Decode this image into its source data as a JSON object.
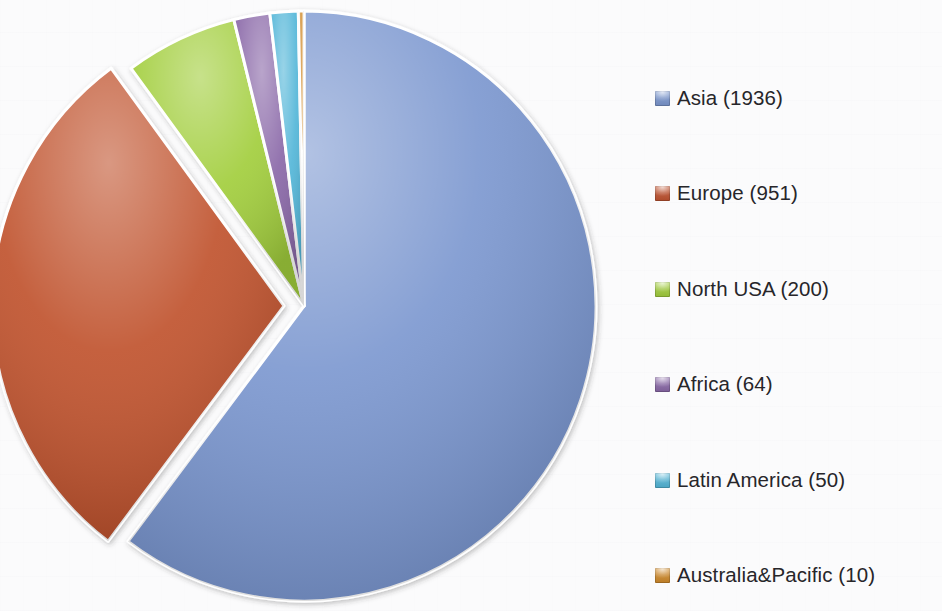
{
  "chart_data": {
    "type": "pie",
    "title": "",
    "subtitle": "",
    "xlabel": "",
    "ylabel": "",
    "grid": false,
    "legend_position": "right",
    "start_angle_deg": 0,
    "direction": "clockwise",
    "total": 3211,
    "categories": [
      "Asia",
      "Europe",
      "North USA",
      "Africa",
      "Latin America",
      "Australia&Pacific"
    ],
    "values": [
      1936,
      951,
      200,
      64,
      50,
      10
    ],
    "percentages": [
      60.3,
      29.6,
      6.2,
      2.0,
      1.6,
      0.3
    ],
    "colors": [
      "#7a96cf",
      "#c0522f",
      "#a2ce3c",
      "#8a68a8",
      "#52b6d8",
      "#d08a2a"
    ],
    "exploded": [
      "Europe"
    ],
    "slices": [
      {
        "label": "Asia",
        "value": 1936,
        "percent": 60.3,
        "color": "#7a96cf",
        "legend_text": "Asia (1936)",
        "exploded": false
      },
      {
        "label": "Europe",
        "value": 951,
        "percent": 29.6,
        "color": "#c0522f",
        "legend_text": "Europe (951)",
        "exploded": true
      },
      {
        "label": "North USA",
        "value": 200,
        "percent": 6.2,
        "color": "#a2ce3c",
        "legend_text": "North USA (200)",
        "exploded": false
      },
      {
        "label": "Africa",
        "value": 64,
        "percent": 2.0,
        "color": "#8a68a8",
        "legend_text": "Africa (64)",
        "exploded": false
      },
      {
        "label": "Latin America",
        "value": 50,
        "percent": 1.6,
        "color": "#52b6d8",
        "legend_text": "Latin America (50)",
        "exploded": false
      },
      {
        "label": "Australia&Pacific",
        "value": 10,
        "percent": 0.3,
        "color": "#d08a2a",
        "legend_text": "Australia&Pacific (10)",
        "exploded": false
      }
    ]
  },
  "legend": {
    "items": [
      {
        "label": "Asia (1936)",
        "color": "#7a96cf"
      },
      {
        "label": "Europe (951)",
        "color": "#c0522f"
      },
      {
        "label": "North USA (200)",
        "color": "#a2ce3c"
      },
      {
        "label": "Africa (64)",
        "color": "#8a68a8"
      },
      {
        "label": "Latin America (50)",
        "color": "#52b6d8"
      },
      {
        "label": "Australia&Pacific (10)",
        "color": "#d08a2a"
      }
    ]
  },
  "geometry": {
    "center_x": 304,
    "center_y": 306,
    "radius_x": 292,
    "radius_y": 295,
    "explode_offset": 20,
    "legend_left": 655,
    "legend_item_y": [
      85,
      180,
      276,
      371,
      467,
      562
    ]
  }
}
